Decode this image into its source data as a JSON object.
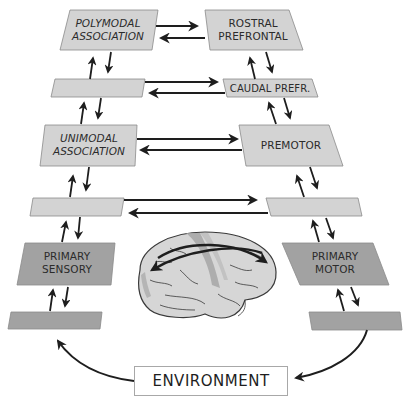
{
  "diagram": {
    "colors": {
      "light_box": "#d3d3d3",
      "dark_box": "#a2a2a2",
      "box_border": "#8a8a8a",
      "arrow": "#1e1e1e",
      "brain_fill": "#d6d6d6",
      "brain_highlight": "#a6a6a6"
    },
    "left_column": {
      "polymodal_association": {
        "line1": "POLYMODAL",
        "line2": "ASSOCIATION"
      },
      "unlabeled_upper": "",
      "unimodal_association": {
        "line1": "UNIMODAL",
        "line2": "ASSOCIATION"
      },
      "unlabeled_middle": "",
      "primary_sensory": {
        "line1": "PRIMARY",
        "line2": "SENSORY"
      },
      "unlabeled_lower": ""
    },
    "right_column": {
      "rostral_prefrontal": {
        "line1": "ROSTRAL",
        "line2": "PREFRONTAL"
      },
      "caudal_prefrontal": "CAUDAL PREFR.",
      "premotor": "PREMOTOR",
      "unlabeled_middle": "",
      "primary_motor": {
        "line1": "PRIMARY",
        "line2": "MOTOR"
      },
      "unlabeled_lower": ""
    },
    "environment": "ENVIRONMENT",
    "brain": "lateral-brain-illustration"
  }
}
